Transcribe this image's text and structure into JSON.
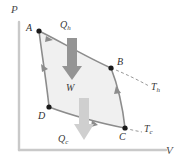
{
  "figure": {
    "kind": "pv-diagram"
  },
  "axes": {
    "y_label": "P",
    "x_label": "V",
    "axis_color": "#c9c9c9",
    "origin_px": [
      19,
      150
    ],
    "y_top_px": [
      19,
      22
    ],
    "x_right_px": [
      166,
      150
    ]
  },
  "cycle": {
    "fill_color": "#f0f0f0",
    "stroke_color": "#8c8c8c",
    "marker_color": "#1a1a1a",
    "points": [
      {
        "id": "A",
        "label": "A",
        "x": 39,
        "y": 31,
        "label_x": 26,
        "label_y": 23
      },
      {
        "id": "B",
        "label": "B",
        "x": 111,
        "y": 68,
        "label_x": 117,
        "label_y": 57
      },
      {
        "id": "C",
        "label": "C",
        "x": 125,
        "y": 128,
        "label_x": 119,
        "label_y": 132
      },
      {
        "id": "D",
        "label": "D",
        "x": 49,
        "y": 107,
        "label_x": 38,
        "label_y": 111
      }
    ],
    "path": "M39,31 C58,40 86,57 111,68 C118,86 123,110 125,128 C103,124 70,115 49,107 C47,86 42,55 39,31"
  },
  "isotherms": [
    {
      "id": "hot",
      "label": "T",
      "subscript": "h",
      "label_x": 151,
      "label_y": 82,
      "dash_path": "M111,68 C126,74 138,80 149,86",
      "color": "#8c8c8c"
    },
    {
      "id": "cold",
      "label": "T",
      "subscript": "c",
      "label_x": 144,
      "label_y": 124,
      "dash_path": "M125,128 C131,130 137,131 142,132",
      "color": "#8c8c8c"
    }
  ],
  "heat_arrows": [
    {
      "id": "Qh",
      "label": "Q",
      "subscript": "h",
      "label_x": 60,
      "label_y": 20,
      "color": "#949494",
      "shaft": {
        "x": 67,
        "y": 38,
        "w": 10,
        "h": 30
      },
      "head": {
        "points": "62,66 82,66 72,80"
      }
    },
    {
      "id": "Qc",
      "label": "Q",
      "subscript": "c",
      "label_x": 58,
      "label_y": 134,
      "color": "#cfcfcf",
      "shaft": {
        "x": 79,
        "y": 98,
        "w": 10,
        "h": 28
      },
      "head": {
        "points": "74,124 94,124 84,140"
      }
    }
  ],
  "work": {
    "label": "W",
    "label_x": 66,
    "label_y": 83
  },
  "flow_arrows": [
    {
      "id": "A-to-B",
      "points": "46,36 53,40 45,42",
      "color": "#8c8c8c"
    },
    {
      "id": "B-to-C",
      "points": "116,86 121,93 114,94",
      "color": "#8c8c8c"
    },
    {
      "id": "C-to-D",
      "points": "98,125 92,120 91,127",
      "color": "#8c8c8c"
    },
    {
      "id": "D-to-A",
      "points": "42,72 41,64 48,69",
      "color": "#8c8c8c"
    }
  ]
}
